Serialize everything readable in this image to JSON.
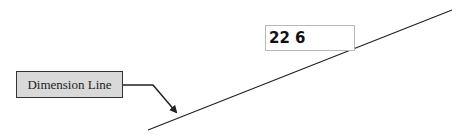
{
  "dimension_input": {
    "value": "22 6"
  },
  "callout": {
    "label": "Dimension Line"
  },
  "colors": {
    "line": "#222222",
    "callout_bg": "#d9d9d9",
    "input_border": "#b8b8b8"
  }
}
